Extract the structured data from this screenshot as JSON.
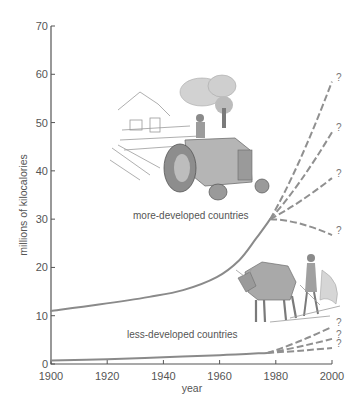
{
  "chart_data": {
    "type": "line",
    "title": "",
    "xlabel": "year",
    "ylabel": "millions of kilocalories",
    "xlim": [
      1900,
      2000
    ],
    "ylim": [
      0,
      70
    ],
    "x_ticks": [
      1900,
      1920,
      1940,
      1960,
      1980,
      2000
    ],
    "y_ticks": [
      0,
      10,
      20,
      30,
      40,
      50,
      60,
      70
    ],
    "grid": false,
    "legend": "none (inline annotations)",
    "series": [
      {
        "name": "more-developed countries",
        "style": "solid",
        "x": [
          1900,
          1917,
          1935,
          1947,
          1959,
          1967,
          1973,
          1978
        ],
        "values": [
          11,
          12.3,
          13.9,
          15.3,
          18,
          21.5,
          26,
          30
        ]
      },
      {
        "name": "less-developed countries",
        "style": "solid",
        "x": [
          1900,
          1920,
          1940,
          1960,
          1977
        ],
        "values": [
          0.7,
          1.0,
          1.4,
          1.8,
          2.3
        ]
      }
    ],
    "projections": [
      {
        "series": "more-developed countries",
        "style": "dashed",
        "x": [
          1978,
          2000
        ],
        "values": [
          30,
          58.5
        ],
        "label": "?"
      },
      {
        "series": "more-developed countries",
        "style": "dashed",
        "x": [
          1978,
          2000
        ],
        "values": [
          30,
          48
        ],
        "label": "?"
      },
      {
        "series": "more-developed countries",
        "style": "dashed",
        "x": [
          1978,
          2000
        ],
        "values": [
          30,
          38.5
        ],
        "label": "?"
      },
      {
        "series": "more-developed countries",
        "style": "dashed",
        "x": [
          1978,
          2000
        ],
        "values": [
          30,
          26.7
        ],
        "label": "?"
      },
      {
        "series": "less-developed countries",
        "style": "dashed",
        "x": [
          1977,
          2000
        ],
        "values": [
          2.3,
          7.7
        ],
        "label": "?"
      },
      {
        "series": "less-developed countries",
        "style": "dashed",
        "x": [
          1977,
          2000
        ],
        "values": [
          2.3,
          5.2
        ],
        "label": "?"
      },
      {
        "series": "less-developed countries",
        "style": "dashed",
        "x": [
          1977,
          2000
        ],
        "values": [
          2.3,
          3.3
        ],
        "label": "?"
      }
    ],
    "annotations": [
      {
        "text": "more-developed countries",
        "x": 1962,
        "y": 31.5
      },
      {
        "text": "less-developed countries",
        "x": 1951,
        "y": 5.2
      }
    ],
    "illustrations": [
      "tractor-with-farmer",
      "ox-plough-with-farmer"
    ]
  },
  "labels": {
    "xlabel": "year",
    "ylabel": "millions of kilocalories",
    "more_developed": "more-developed countries",
    "less_developed": "less-developed countries",
    "question_mark": "?"
  }
}
